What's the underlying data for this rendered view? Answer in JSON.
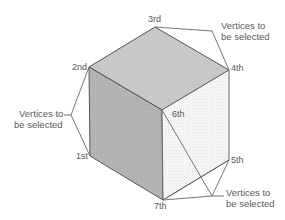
{
  "diagram": {
    "type": "isometric cube vertex selection",
    "colors": {
      "top_face": "#c9c9c9",
      "left_face": "#b3b3b3",
      "right_face": "#f4f4f4",
      "edge": "#555555",
      "leader_line": "#666666",
      "text": "#555555"
    },
    "vertices": [
      {
        "id": "v1",
        "label": "1st",
        "x": 90,
        "y": 156
      },
      {
        "id": "v2",
        "label": "2nd",
        "x": 89,
        "y": 67
      },
      {
        "id": "v3",
        "label": "3rd",
        "x": 155,
        "y": 27
      },
      {
        "id": "v4",
        "label": "4th",
        "x": 229,
        "y": 70
      },
      {
        "id": "v5",
        "label": "5th",
        "x": 229,
        "y": 160
      },
      {
        "id": "v6",
        "label": "6th",
        "x": 162,
        "y": 110
      },
      {
        "id": "v7",
        "label": "7th",
        "x": 163,
        "y": 200
      }
    ],
    "callouts": [
      {
        "id": "callout-top-right",
        "line1": "Vertices to",
        "line2": "be selected",
        "targets": [
          "3rd",
          "4th"
        ]
      },
      {
        "id": "callout-left",
        "line1": "Vertices to",
        "line2": "be selected",
        "targets": [
          "2nd",
          "1st"
        ]
      },
      {
        "id": "callout-bottom-right",
        "line1": "Vertices to",
        "line2": "be selected",
        "targets": [
          "6th",
          "5th",
          "7th"
        ]
      }
    ]
  }
}
